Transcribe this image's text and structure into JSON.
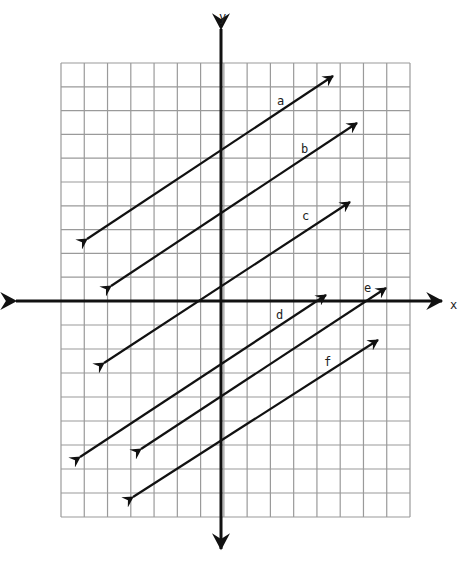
{
  "diagram": {
    "type": "coordinate-plane-parallel-lines",
    "axes": {
      "x_label": "x",
      "y_label": "y"
    },
    "grid": {
      "columns_left_of_y_axis": 7,
      "columns_right_of_y_axis": 8,
      "rows_above_x_axis": 10,
      "rows_below_x_axis": 9,
      "line_color": "#9a9a9a"
    },
    "lines": [
      {
        "label": "a",
        "x1": 87,
        "y1": 239,
        "x2": 333,
        "y2": 76,
        "label_x": 281,
        "label_y": 105
      },
      {
        "label": "b",
        "x1": 111,
        "y1": 286,
        "x2": 357,
        "y2": 123,
        "label_x": 305,
        "label_y": 153
      },
      {
        "label": "c",
        "x1": 104,
        "y1": 363,
        "x2": 350,
        "y2": 202,
        "label_x": 306,
        "label_y": 220
      },
      {
        "label": "d",
        "x1": 80,
        "y1": 457,
        "x2": 326,
        "y2": 295,
        "label_x": 280,
        "label_y": 319
      },
      {
        "label": "e",
        "x1": 141,
        "y1": 449,
        "x2": 386,
        "y2": 288,
        "label_x": 368,
        "label_y": 292
      },
      {
        "label": "f",
        "x1": 133,
        "y1": 497,
        "x2": 378,
        "y2": 340,
        "label_x": 328,
        "label_y": 366
      }
    ],
    "stroke_color": "#111111"
  }
}
